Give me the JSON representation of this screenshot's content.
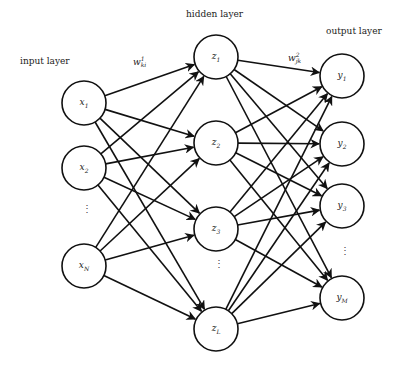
{
  "diagram": {
    "type": "feedforward-neural-network",
    "layers": [
      {
        "id": "input",
        "label": "input layer",
        "label_pos": [
          20,
          56
        ],
        "x": 84,
        "nodes": [
          {
            "id": "x1",
            "var": "x",
            "sub": "1",
            "y": 103
          },
          {
            "id": "x2",
            "var": "x",
            "sub": "2",
            "y": 168
          },
          {
            "id": "xN",
            "var": "x",
            "sub": "N",
            "y": 266
          }
        ],
        "ellipsis_y": 213
      },
      {
        "id": "hidden",
        "label": "hidden layer",
        "label_pos": [
          186,
          9
        ],
        "x": 216,
        "nodes": [
          {
            "id": "z1",
            "var": "z",
            "sub": "1",
            "y": 57
          },
          {
            "id": "z2",
            "var": "z",
            "sub": "2",
            "y": 143
          },
          {
            "id": "z3",
            "var": "z",
            "sub": "3",
            "y": 229
          },
          {
            "id": "zL",
            "var": "z",
            "sub": "L",
            "y": 329
          }
        ],
        "ellipsis_y": 268
      },
      {
        "id": "output",
        "label": "output layer",
        "label_pos": [
          326,
          26
        ],
        "x": 342,
        "nodes": [
          {
            "id": "y1",
            "var": "y",
            "sub": "1",
            "y": 76
          },
          {
            "id": "y2",
            "var": "y",
            "sub": "2",
            "y": 144
          },
          {
            "id": "y3",
            "var": "y",
            "sub": "3",
            "y": 206
          },
          {
            "id": "yM",
            "var": "y",
            "sub": "M",
            "y": 298
          }
        ],
        "ellipsis_y": 255
      }
    ],
    "node_radius": 22,
    "weights": [
      {
        "id": "w1",
        "base": "w",
        "sup": "1",
        "sub": "ki",
        "pos": [
          133,
          56
        ]
      },
      {
        "id": "w2",
        "base": "w",
        "sup": "2",
        "sub": "jk",
        "pos": [
          288,
          52
        ]
      }
    ],
    "connections": "fully-connected between adjacent layers, arrows pointing right",
    "stroke_color": "#111111",
    "ellipsis_symbol": "⋮"
  }
}
